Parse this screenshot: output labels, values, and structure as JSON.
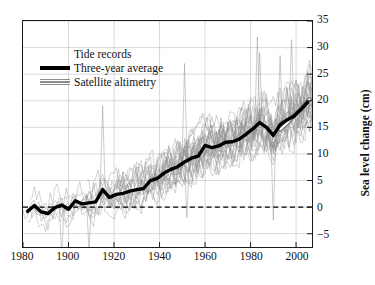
{
  "chart_data": {
    "type": "line",
    "title": "",
    "xlabel": "",
    "ylabel": "Sea level change (cm)",
    "xlim": [
      1880,
      2007
    ],
    "ylim": [
      -7.5,
      35
    ],
    "grid": true,
    "legend_position": "upper-left",
    "xticks": [
      1880,
      1900,
      1920,
      1940,
      1960,
      1980,
      2000
    ],
    "yticks": [
      -5,
      0,
      5,
      10,
      15,
      20,
      25,
      30,
      35
    ],
    "zero_reference_line": 0,
    "colors": {
      "tide_records": "#8d8d8d",
      "three_year_average": "#000000",
      "satellite_altimetry": "#9a9a9a",
      "grid": "#c8c8c8",
      "axis": "#1a1a1a"
    },
    "series": [
      {
        "name": "Tide records",
        "style": "thin-gray-ensemble",
        "description": "Many individual noisy tide gauge records, band widens over time"
      },
      {
        "name": "Three-year average",
        "style": "thick-black",
        "x": [
          1882,
          1885,
          1888,
          1891,
          1894,
          1897,
          1900,
          1903,
          1906,
          1909,
          1912,
          1915,
          1918,
          1921,
          1924,
          1927,
          1930,
          1933,
          1936,
          1939,
          1942,
          1945,
          1948,
          1951,
          1954,
          1957,
          1960,
          1963,
          1966,
          1969,
          1972,
          1975,
          1978,
          1981,
          1984,
          1987,
          1990,
          1993,
          1996,
          1999,
          2002,
          2005
        ],
        "values": [
          -0.8,
          0.3,
          -0.9,
          -1.2,
          -0.1,
          0.4,
          -0.4,
          1.2,
          0.6,
          0.8,
          1.0,
          3.3,
          1.8,
          2.4,
          2.6,
          3.0,
          3.3,
          3.5,
          5.0,
          5.4,
          6.4,
          7.1,
          7.6,
          8.5,
          9.2,
          9.6,
          11.6,
          11.2,
          11.5,
          12.2,
          12.3,
          12.8,
          13.7,
          14.7,
          15.9,
          15.0,
          13.5,
          15.5,
          16.4,
          17.1,
          18.3,
          19.7
        ]
      },
      {
        "name": "Satellite altimetry",
        "style": "gray-band",
        "x": [
          1993,
          1995,
          1997,
          1999,
          2001,
          2003,
          2005,
          2006
        ],
        "values": [
          14.6,
          15.4,
          16.2,
          17.1,
          18.0,
          18.9,
          19.8,
          20.3
        ]
      }
    ]
  },
  "axes": {
    "y_title": "Sea level change (cm)",
    "y_tick_labels": [
      "35",
      "30",
      "25",
      "20",
      "15",
      "10",
      "5",
      "0",
      "−5"
    ],
    "x_tick_labels": [
      "1980",
      "1900",
      "1920",
      "1940",
      "1960",
      "1980",
      "2000"
    ]
  },
  "legend": {
    "items": [
      {
        "label": "Tide records",
        "swatch": "blank"
      },
      {
        "label": "Three-year average",
        "swatch": "solid-black"
      },
      {
        "label": "Satellite altimetry",
        "swatch": "gray-band"
      }
    ]
  }
}
